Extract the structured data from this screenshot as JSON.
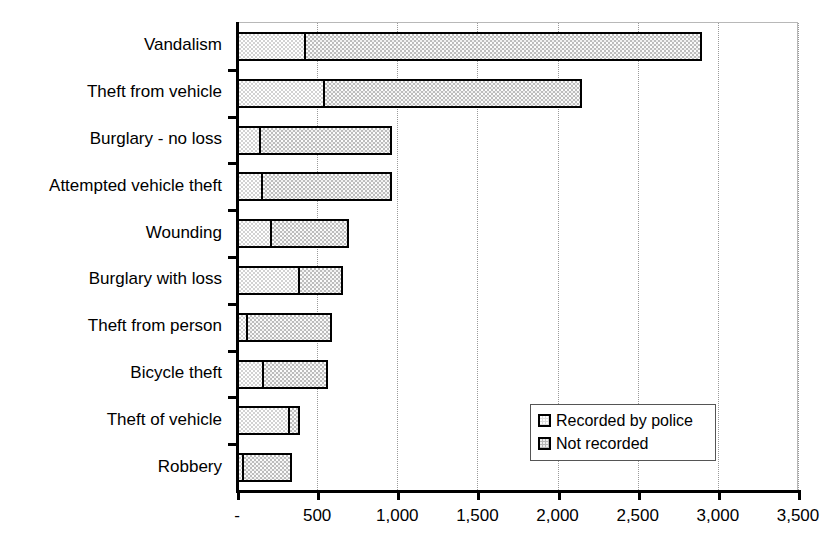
{
  "chart_data": {
    "type": "bar",
    "orientation": "horizontal",
    "stacked": true,
    "title": "",
    "subtitle": "",
    "xlabel": "",
    "ylabel": "",
    "categories": [
      "Vandalism",
      "Theft from vehicle",
      "Burglary - no loss",
      "Attempted vehicle theft",
      "Wounding",
      "Burglary with loss",
      "Theft from person",
      "Bicycle theft",
      "Theft of vehicle",
      "Robbery"
    ],
    "series": [
      {
        "name": "Recorded by police",
        "values": [
          430,
          550,
          150,
          165,
          220,
          390,
          70,
          170,
          330,
          45
        ]
      },
      {
        "name": "Not recorded",
        "values": [
          2470,
          1600,
          820,
          800,
          480,
          270,
          520,
          395,
          65,
          300
        ]
      }
    ],
    "totals": [
      2900,
      2150,
      970,
      965,
      700,
      660,
      590,
      565,
      395,
      345
    ],
    "xlim": [
      0,
      3500
    ],
    "xticks": [
      0,
      500,
      1000,
      1500,
      2000,
      2500,
      3000,
      3500
    ],
    "xtick_labels": [
      "-",
      "500",
      "1,000",
      "1,500",
      "2,000",
      "2,500",
      "3,000",
      "3,500"
    ],
    "grid": true,
    "grid_axis": "x",
    "legend_position": "inside-lower-right",
    "legend_entries": [
      {
        "label": "Recorded by police",
        "key": "recorded"
      },
      {
        "label": "Not recorded",
        "key": "notrecorded"
      }
    ],
    "colors": {
      "recorded": "#d2d2d2",
      "notrecorded": "#bdbdbd",
      "bar_border": "#000000",
      "axis": "#000000",
      "gridline": "#9a9a9a",
      "text": "#000000",
      "background": "#ffffff"
    }
  }
}
